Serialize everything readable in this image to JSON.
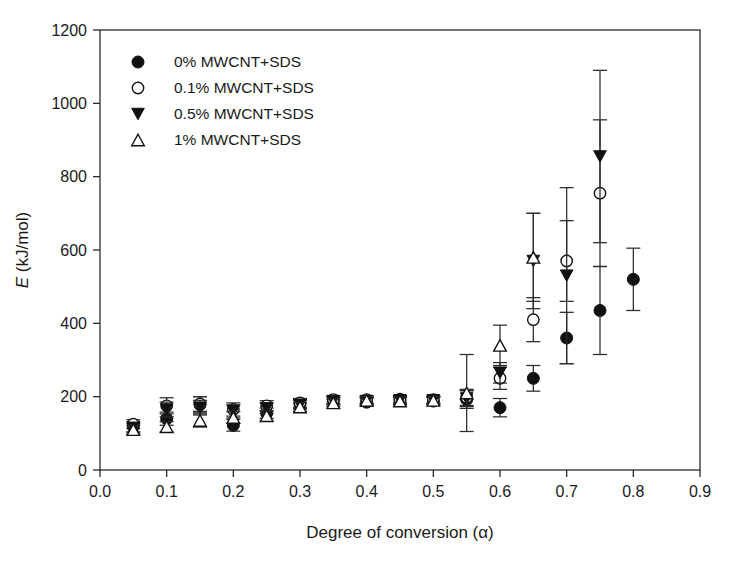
{
  "chart_data": {
    "type": "scatter",
    "title": "",
    "xlabel": "Degree of conversion (α)",
    "ylabel": "E (kJ/mol)",
    "ylabel_symbol": "E",
    "ylabel_units": " (kJ/mol)",
    "xlim": [
      0.0,
      0.9
    ],
    "ylim": [
      0,
      1200
    ],
    "xticks": [
      "0.0",
      "0.1",
      "0.2",
      "0.3",
      "0.4",
      "0.5",
      "0.6",
      "0.7",
      "0.8",
      "0.9"
    ],
    "xtick_values": [
      0.0,
      0.1,
      0.2,
      0.3,
      0.4,
      0.5,
      0.6,
      0.7,
      0.8,
      0.9
    ],
    "yticks": [
      "0",
      "200",
      "400",
      "600",
      "800",
      "1000",
      "1200"
    ],
    "ytick_values": [
      0,
      200,
      400,
      600,
      800,
      1000,
      1200
    ],
    "grid": false,
    "legend_position": "upper-left",
    "error_bars": "symmetric-vertical",
    "series": [
      {
        "name": "0% MWCNT+SDS",
        "marker": "filled-circle",
        "color": "#111111",
        "x": [
          0.05,
          0.1,
          0.15,
          0.2,
          0.25,
          0.3,
          0.35,
          0.4,
          0.45,
          0.5,
          0.55,
          0.6,
          0.65,
          0.7,
          0.75,
          0.8
        ],
        "values": [
          118,
          140,
          178,
          122,
          155,
          180,
          190,
          185,
          190,
          188,
          192,
          170,
          250,
          360,
          435,
          520
        ],
        "errors": [
          14,
          18,
          22,
          16,
          14,
          12,
          12,
          10,
          10,
          10,
          24,
          25,
          35,
          70,
          120,
          85
        ]
      },
      {
        "name": "0.1% MWCNT+SDS",
        "marker": "open-circle",
        "color": "#111111",
        "x": [
          0.05,
          0.1,
          0.15,
          0.2,
          0.25,
          0.3,
          0.35,
          0.4,
          0.45,
          0.5,
          0.55,
          0.6,
          0.65,
          0.7,
          0.75
        ],
        "values": [
          125,
          175,
          180,
          165,
          175,
          183,
          192,
          192,
          193,
          192,
          198,
          250,
          410,
          570,
          755
        ],
        "errors": [
          12,
          22,
          20,
          18,
          14,
          12,
          10,
          10,
          10,
          10,
          22,
          30,
          60,
          110,
          200
        ]
      },
      {
        "name": "0.5% MWCNT+SDS",
        "marker": "filled-down-triangle",
        "color": "#111111",
        "x": [
          0.05,
          0.1,
          0.15,
          0.2,
          0.25,
          0.3,
          0.35,
          0.4,
          0.45,
          0.5,
          0.55,
          0.6,
          0.65,
          0.7,
          0.75
        ],
        "values": [
          115,
          165,
          170,
          160,
          168,
          178,
          188,
          188,
          190,
          190,
          195,
          265,
          570,
          530,
          855
        ],
        "errors": [
          12,
          20,
          20,
          18,
          14,
          12,
          10,
          10,
          10,
          10,
          22,
          28,
          130,
          240,
          235
        ]
      },
      {
        "name": "1% MWCNT+SDS",
        "marker": "open-up-triangle",
        "color": "#111111",
        "x": [
          0.05,
          0.1,
          0.15,
          0.2,
          0.25,
          0.3,
          0.35,
          0.4,
          0.45,
          0.5,
          0.55,
          0.6,
          0.65
        ],
        "values": [
          110,
          118,
          135,
          143,
          148,
          172,
          183,
          190,
          188,
          190,
          210,
          340,
          580
        ],
        "errors": [
          12,
          14,
          18,
          16,
          14,
          12,
          10,
          10,
          10,
          10,
          105,
          55,
          120
        ]
      }
    ]
  },
  "legend": {
    "items": [
      {
        "label": "0% MWCNT+SDS",
        "marker": "filled-circle"
      },
      {
        "label": "0.1% MWCNT+SDS",
        "marker": "open-circle"
      },
      {
        "label": "0.5% MWCNT+SDS",
        "marker": "filled-down-triangle"
      },
      {
        "label": "1% MWCNT+SDS",
        "marker": "open-up-triangle"
      }
    ]
  }
}
